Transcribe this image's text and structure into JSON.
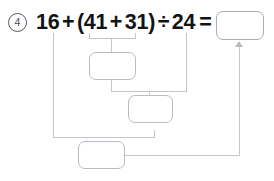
{
  "page": {
    "type": "math-worksheet-problem",
    "background_color": "#ffffff",
    "ink_color": "#131316",
    "line_color": "#c3c6cb",
    "box_border_color": "#b9bcc2"
  },
  "problem": {
    "number_label": "4",
    "number_style": "circled",
    "expression": {
      "full_text": "16 + (41 + 31) ÷ 24 =",
      "tokens": [
        "16",
        "+",
        "(41",
        "+",
        "31)",
        "÷",
        "24",
        "="
      ]
    }
  },
  "answer_box": {
    "label": "answer-box",
    "value": "",
    "placeholder": ""
  },
  "work_boxes": [
    {
      "name": "step-1-box",
      "value": "",
      "placeholder": ""
    },
    {
      "name": "step-2-box",
      "value": "",
      "placeholder": ""
    },
    {
      "name": "step-3-box",
      "value": "",
      "placeholder": ""
    }
  ],
  "annotations": {
    "bracket_under_parentheses": "(41 + 31)",
    "arrow_target": "answer-box",
    "arrow_direction": "up"
  }
}
